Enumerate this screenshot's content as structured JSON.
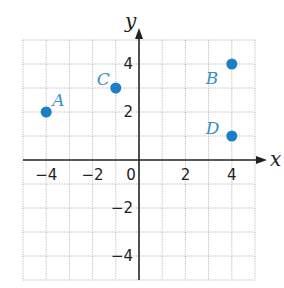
{
  "chart_data": {
    "type": "scatter",
    "title": "",
    "xlabel": "x",
    "ylabel": "y",
    "xlim": [
      -5,
      5
    ],
    "ylim": [
      -5,
      5
    ],
    "grid": true,
    "x_ticks": [
      {
        "value": -4,
        "label": "−4"
      },
      {
        "value": -2,
        "label": "−2"
      },
      {
        "value": 0,
        "label": "0"
      },
      {
        "value": 2,
        "label": "2"
      },
      {
        "value": 4,
        "label": "4"
      }
    ],
    "y_ticks": [
      {
        "value": 4,
        "label": "4"
      },
      {
        "value": 2,
        "label": "2"
      },
      {
        "value": -2,
        "label": "−2"
      },
      {
        "value": -4,
        "label": "−4"
      }
    ],
    "points": [
      {
        "label": "A",
        "x": -4,
        "y": 2,
        "label_dx": 6,
        "label_dy": -6
      },
      {
        "label": "B",
        "x": 4,
        "y": 4,
        "label_dx": -26,
        "label_dy": 20
      },
      {
        "label": "C",
        "x": -1,
        "y": 3,
        "label_dx": -19,
        "label_dy": -3
      },
      {
        "label": "D",
        "x": 4,
        "y": 1,
        "label_dx": -26,
        "label_dy": -2
      }
    ]
  },
  "colors": {
    "point": "#1b7fc6",
    "point_label": "#3b8fc9",
    "grid": "#b9b9b9",
    "axis": "#222222"
  }
}
